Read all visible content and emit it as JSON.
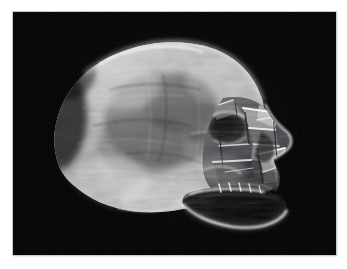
{
  "page": {
    "background_color": "#ffffff",
    "width": 347,
    "height": 269,
    "kind": "photographic-print"
  },
  "photo": {
    "title": "Carved rock-crystal skull",
    "border_color": "#c9c9c9",
    "background_color": "#000000",
    "orientation": "landscape",
    "frame": {
      "left": 13,
      "top": 12,
      "width": 323,
      "height": 243
    }
  },
  "subject": {
    "name": "crystal-skull",
    "material": "clear quartz / rock crystal",
    "view": "left lateral three-quarter profile, facing right",
    "lighting": "dark-field backlight with strong specular rim highlights",
    "palette": {
      "background": "#000000",
      "cranium_mid": "#6e6e70",
      "cranium_light": "#d8d8d6",
      "cranium_highlight": "#f2f2f0",
      "cranium_shadow": "#2a2a2c",
      "facet_bright": "#ffffff",
      "facet_mid": "#9a9a9c",
      "jaw_dark": "#0c0c0e",
      "rim_light": "#e8e8e6"
    },
    "regions": [
      {
        "id": "cranium",
        "label": "Cranial vault",
        "texture": "mottled frosted crystal with fibrous internal crackle"
      },
      {
        "id": "temporal",
        "label": "Temporal ridge",
        "texture": "smooth polished with soft gradient"
      },
      {
        "id": "orbit",
        "label": "Right eye socket",
        "texture": "deep faceted hollow"
      },
      {
        "id": "maxilla",
        "label": "Maxilla and cheek",
        "texture": "sharp angular facets, strong speculars"
      },
      {
        "id": "mandible",
        "label": "Mandible / jawline",
        "texture": "near-transparent with bright edge rim-light"
      },
      {
        "id": "occiput",
        "label": "Occipital region",
        "texture": "bright diffuse glow fading to black"
      }
    ]
  }
}
